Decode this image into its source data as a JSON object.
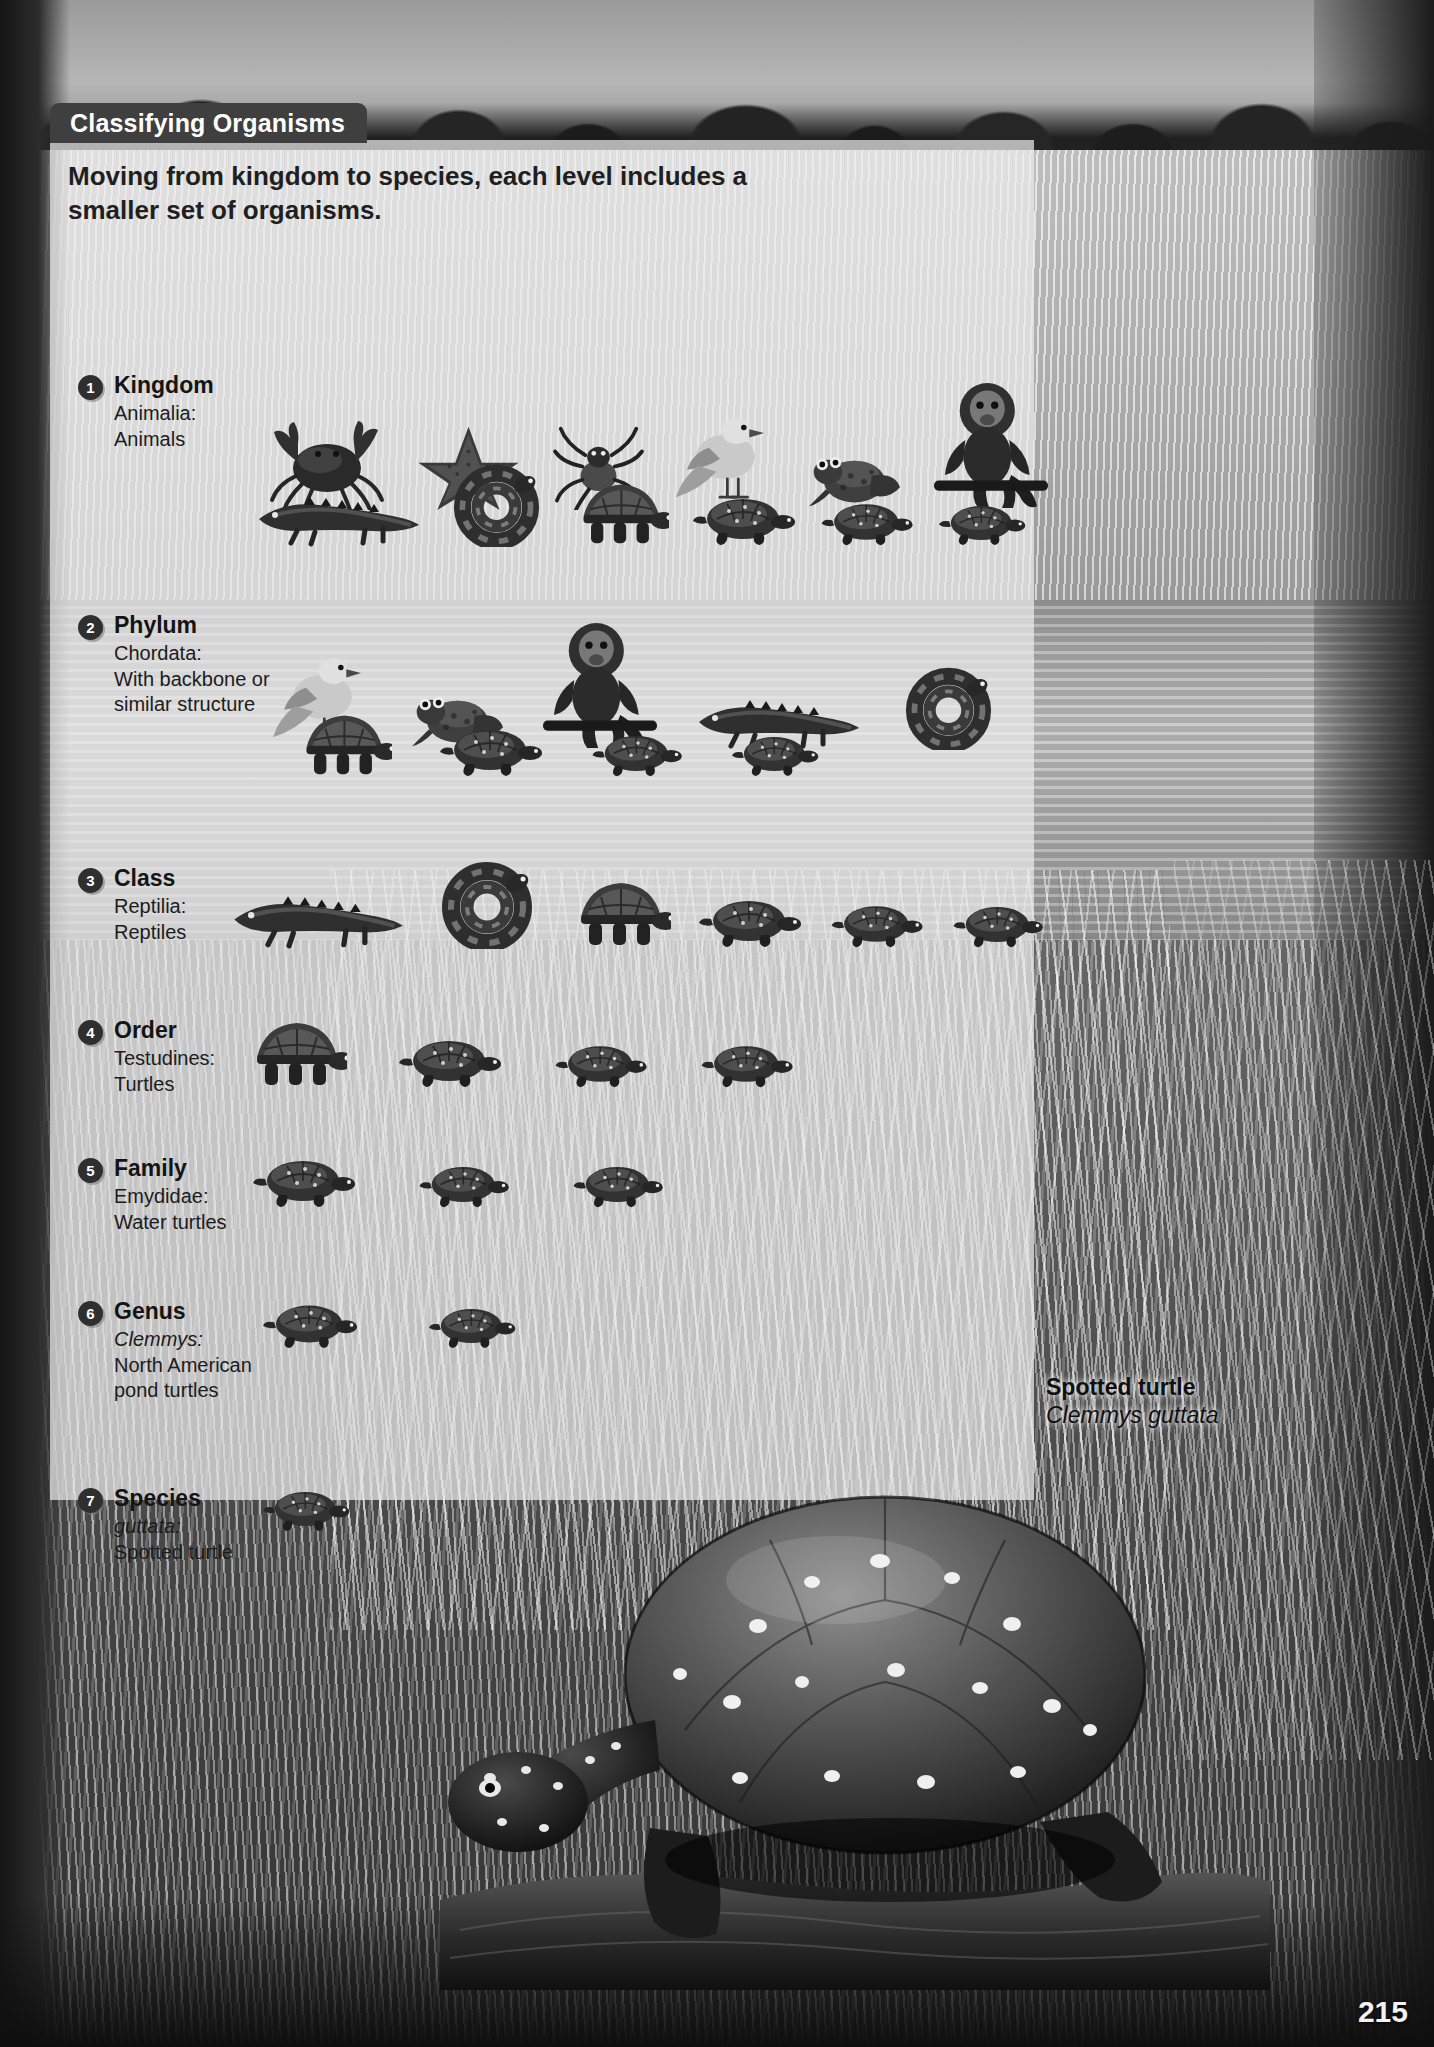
{
  "page": {
    "number": "215",
    "header_title": "Classifying Organisms",
    "intro": "Moving from kingdom to species, each level includes a smaller set of organisms."
  },
  "ranks": [
    {
      "number": "1",
      "name": "Kingdom",
      "taxon": "Animalia:",
      "meaning": "Animals",
      "taxon_italic": false,
      "organisms": [
        [
          "crab",
          "starfish",
          "spider",
          "dove",
          "frog",
          "monkey"
        ],
        [
          "crocodile",
          "snake",
          "tortoise",
          "turtle",
          "turtle",
          "turtle"
        ]
      ]
    },
    {
      "number": "2",
      "name": "Phylum",
      "taxon": "Chordata:",
      "meaning": "With backbone or similar structure",
      "taxon_italic": false,
      "organisms": [
        [
          "dove",
          "frog",
          "monkey",
          "crocodile",
          "snake"
        ],
        [
          "tortoise",
          "turtle",
          "turtle",
          "turtle"
        ]
      ]
    },
    {
      "number": "3",
      "name": "Class",
      "taxon": "Reptilia:",
      "meaning": "Reptiles",
      "taxon_italic": false,
      "organisms": [
        [
          "crocodile",
          "snake",
          "tortoise",
          "turtle",
          "turtle",
          "turtle"
        ]
      ]
    },
    {
      "number": "4",
      "name": "Order",
      "taxon": "Testudines:",
      "meaning": "Turtles",
      "taxon_italic": false,
      "organisms": [
        [
          "tortoise",
          "turtle",
          "turtle",
          "turtle"
        ]
      ]
    },
    {
      "number": "5",
      "name": "Family",
      "taxon": "Emydidae:",
      "meaning": "Water turtles",
      "taxon_italic": false,
      "organisms": [
        [
          "turtle",
          "turtle",
          "turtle"
        ]
      ]
    },
    {
      "number": "6",
      "name": "Genus",
      "taxon": "Clemmys:",
      "meaning": "North American pond turtles",
      "taxon_italic": true,
      "organisms": [
        [
          "turtle",
          "turtle"
        ]
      ]
    },
    {
      "number": "7",
      "name": "Species",
      "taxon": "guttata:",
      "meaning": "Spotted turtle",
      "taxon_italic": true,
      "organisms": [
        [
          "turtle"
        ]
      ]
    }
  ],
  "photo_caption": {
    "common_name": "Spotted turtle",
    "scientific_name": "Clemmys guttata"
  },
  "colors": {
    "header_bar": "#3f3f3f",
    "badge": "#2f2f2f",
    "panel": "rgba(236,236,236,0.72)",
    "text": "#1c1c1c"
  }
}
